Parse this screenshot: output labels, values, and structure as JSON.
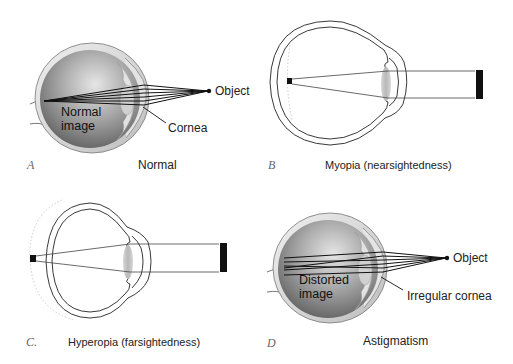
{
  "figure": {
    "panels": [
      {
        "letter": "A",
        "caption": "Normal",
        "labels": {
          "object": "Object",
          "image_line1": "Normal",
          "image_line2": "image",
          "pointer": "Cornea"
        }
      },
      {
        "letter": "B",
        "caption": "Myopia (nearsightedness)"
      },
      {
        "letter": "C.",
        "caption": "Hyperopia (farsightedness)"
      },
      {
        "letter": "D",
        "caption": "Astigmatism",
        "labels": {
          "object": "Object",
          "image_line1": "Distorted",
          "image_line2": "image",
          "pointer": "Irregular cornea"
        }
      }
    ],
    "colors": {
      "background": "#ffffff",
      "eye_dark": "#5a5a5a",
      "eye_light": "#d8d8d8",
      "line": "#111111",
      "lens_gray": "#bdbdbd",
      "dotted_outline": "#c8c8c8"
    }
  }
}
